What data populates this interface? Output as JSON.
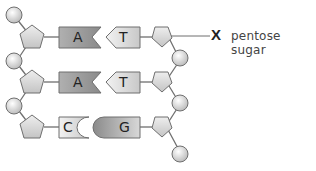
{
  "diagram": {
    "pairs": [
      {
        "left_base": "A",
        "right_base": "T"
      },
      {
        "left_base": "A",
        "right_base": "T"
      },
      {
        "left_base": "C",
        "right_base": "G"
      }
    ],
    "annotation": {
      "marker": "X",
      "text": "pentose sugar"
    },
    "colors": {
      "phosphate": "#d9d9d9",
      "sugar": "#d6d6d6",
      "base_dark": "#9e9e9e",
      "base_light": "#d4d4d4",
      "stroke": "#6f6f6f"
    }
  }
}
